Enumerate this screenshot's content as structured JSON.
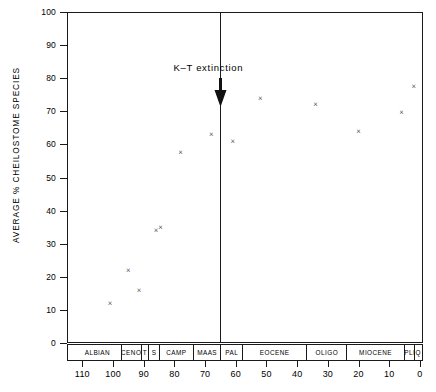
{
  "chart_data": {
    "type": "scatter",
    "title": "",
    "xlabel": "",
    "ylabel": "AVERAGE % CHEILOSTOME SPECIES",
    "xlim": [
      115,
      -1
    ],
    "ylim": [
      0,
      100
    ],
    "x_axis_direction": "reversed",
    "x_unit": "Ma",
    "grid": false,
    "legend": null,
    "marker": "x",
    "x_ticks": [
      110,
      100,
      90,
      80,
      70,
      60,
      50,
      40,
      30,
      20,
      10,
      0
    ],
    "y_ticks": [
      0,
      10,
      20,
      30,
      40,
      50,
      60,
      70,
      80,
      90,
      100
    ],
    "points": [
      {
        "x": 101.0,
        "y": 12.0
      },
      {
        "x": 95.0,
        "y": 22.0
      },
      {
        "x": 91.5,
        "y": 16.0
      },
      {
        "x": 86.0,
        "y": 34.0
      },
      {
        "x": 84.5,
        "y": 35.0
      },
      {
        "x": 78.0,
        "y": 57.5
      },
      {
        "x": 68.0,
        "y": 63.0
      },
      {
        "x": 61.0,
        "y": 61.0
      },
      {
        "x": 52.0,
        "y": 74.0
      },
      {
        "x": 34.0,
        "y": 72.0
      },
      {
        "x": 20.0,
        "y": 64.0
      },
      {
        "x": 6.0,
        "y": 69.5
      },
      {
        "x": 2.0,
        "y": 77.5
      }
    ],
    "annotations": [
      {
        "name": "k-t-extinction",
        "label": "K–T  extinction",
        "x": 65.0,
        "marker": "vertical-line-with-down-arrow",
        "line_top_y": 100,
        "line_bottom_y": 0
      }
    ],
    "stratigraphic_axis": {
      "name": "geologic-stage-bar",
      "cells": [
        {
          "label": "ALBIAN",
          "start": 113,
          "end": 97.5
        },
        {
          "label": "CENO",
          "start": 97.5,
          "end": 91.0
        },
        {
          "label": "T",
          "start": 91.0,
          "end": 88.5
        },
        {
          "label": "S",
          "start": 88.5,
          "end": 85.0
        },
        {
          "label": "CAMP",
          "start": 85.0,
          "end": 74.0
        },
        {
          "label": "MAAS",
          "start": 74.0,
          "end": 65.0
        },
        {
          "label": "PAL",
          "start": 65.0,
          "end": 58.0
        },
        {
          "label": "EOCENE",
          "start": 58.0,
          "end": 37.0
        },
        {
          "label": "OLIGO",
          "start": 37.0,
          "end": 24.0
        },
        {
          "label": "MIOCENE",
          "start": 24.0,
          "end": 5.2
        },
        {
          "label": "PLI",
          "start": 5.2,
          "end": 1.8
        },
        {
          "label": "Q",
          "start": 1.8,
          "end": 0.0
        }
      ]
    }
  }
}
